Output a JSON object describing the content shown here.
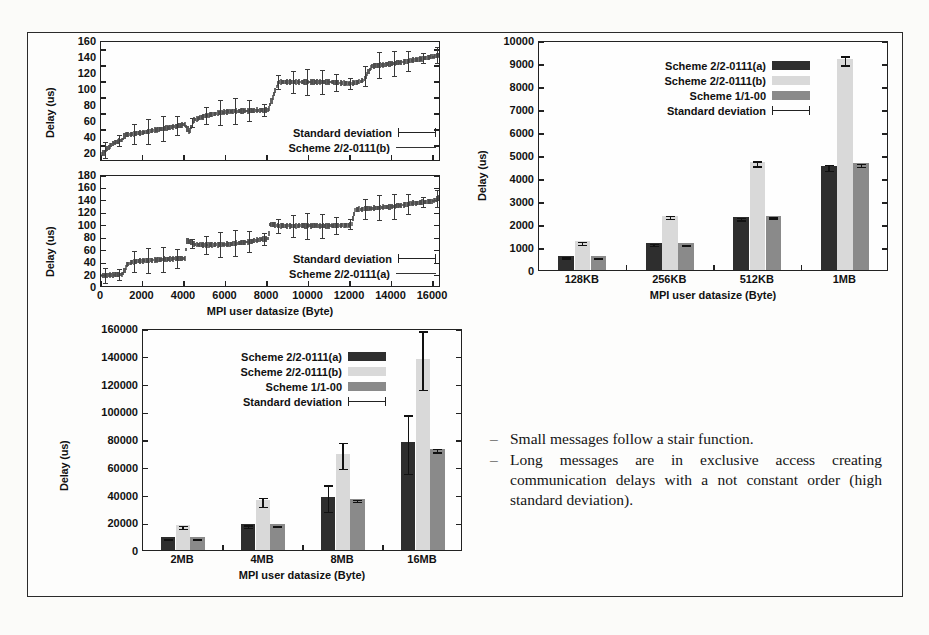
{
  "slide": {
    "bullets": [
      "Small messages follow a stair function.",
      "Long messages are in exclusive access creating communication delays with a not constant order (high standard deviation)."
    ],
    "bullet_dash": "–"
  },
  "legend_labels": {
    "scheme_a": "Scheme 2/2-0111(a)",
    "scheme_b": "Scheme 2/2-0111(b)",
    "scheme_c": "Scheme 1/1-00",
    "stddev": "Standard deviation"
  },
  "colors": {
    "scheme_a": "#2e2e2e",
    "scheme_b": "#d9d9d9",
    "scheme_c": "#8a8a8a",
    "axis": "#222222",
    "frame": "#2b2b2b",
    "background": "#fbfbf9"
  },
  "chart_data": [
    {
      "id": "top-left-upper",
      "type": "line",
      "title": "",
      "xlabel": "",
      "ylabel": "Delay (us)",
      "xlim": [
        0,
        16384
      ],
      "ylim": [
        10,
        160
      ],
      "yticks": [
        20,
        40,
        60,
        80,
        100,
        120,
        140,
        160
      ],
      "xticks": [
        0,
        2000,
        4000,
        6000,
        8000,
        10000,
        12000,
        14000,
        16000
      ],
      "xticklabels": [
        "",
        "",
        "",
        "",
        "",
        "",
        "",
        "",
        ""
      ],
      "grid": false,
      "legend_position": "bottom-right",
      "legend": [
        "Standard deviation",
        "Scheme 2/2-0111(b)"
      ],
      "series": [
        {
          "name": "Scheme 2/2-0111(b)",
          "x": [
            0,
            500,
            1000,
            1100,
            1500,
            2000,
            3000,
            4000,
            4200,
            4400,
            5000,
            6000,
            7000,
            8000,
            8300,
            8500,
            9000,
            10000,
            11000,
            12000,
            12600,
            13000,
            14000,
            15000,
            16000,
            16384
          ],
          "values": [
            20,
            33,
            38,
            44,
            45,
            47,
            52,
            57,
            46,
            62,
            68,
            73,
            74,
            75,
            96,
            110,
            110,
            110,
            110,
            108,
            112,
            130,
            133,
            137,
            142,
            145
          ]
        }
      ]
    },
    {
      "id": "top-left-lower",
      "type": "line",
      "title": "",
      "xlabel": "MPI user datasize (Byte)",
      "ylabel": "Delay (us)",
      "xlim": [
        0,
        16384
      ],
      "ylim": [
        0,
        180
      ],
      "yticks": [
        0,
        20,
        40,
        60,
        80,
        100,
        120,
        140,
        160,
        180
      ],
      "xticks": [
        0,
        2000,
        4000,
        6000,
        8000,
        10000,
        12000,
        14000,
        16000
      ],
      "xticklabels": [
        "0",
        "2000",
        "4000",
        "6000",
        "8000",
        "10000",
        "12000",
        "14000",
        "16000"
      ],
      "grid": false,
      "legend_position": "bottom-right",
      "legend": [
        "Standard deviation",
        "Scheme 2/2-0111(a)"
      ],
      "series": [
        {
          "name": "Scheme 2/2-0111(a)",
          "x": [
            0,
            500,
            1000,
            1200,
            1500,
            2000,
            3000,
            4000,
            4100,
            4500,
            5000,
            6000,
            7000,
            8000,
            8100,
            8500,
            9000,
            10000,
            11000,
            12000,
            12200,
            13000,
            14000,
            15000,
            16000,
            16384
          ],
          "values": [
            20,
            21,
            22,
            38,
            42,
            44,
            46,
            48,
            76,
            70,
            69,
            70,
            74,
            80,
            103,
            100,
            100,
            100,
            100,
            101,
            126,
            128,
            131,
            136,
            140,
            148
          ]
        }
      ]
    },
    {
      "id": "top-right",
      "type": "bar",
      "title": "",
      "xlabel": "MPI user datasize (Byte)",
      "ylabel": "Delay (us)",
      "categories": [
        "128KB",
        "256KB",
        "512KB",
        "1MB"
      ],
      "yticks": [
        0,
        1000,
        2000,
        3000,
        4000,
        5000,
        6000,
        7000,
        8000,
        9000,
        10000
      ],
      "ylim": [
        0,
        10000
      ],
      "grid": false,
      "legend_position": "top-center",
      "series": [
        {
          "name": "Scheme 2/2-0111(a)",
          "values": [
            620,
            1190,
            2300,
            4540
          ],
          "errors": [
            25,
            40,
            60,
            130
          ]
        },
        {
          "name": "Scheme 2/2-0111(b)",
          "values": [
            1250,
            2370,
            4700,
            9180
          ],
          "errors": [
            60,
            70,
            110,
            190
          ]
        },
        {
          "name": "Scheme 1/1-00",
          "values": [
            600,
            1170,
            2340,
            4640
          ],
          "errors": [
            20,
            25,
            40,
            55
          ]
        }
      ]
    },
    {
      "id": "bottom-left",
      "type": "bar",
      "title": "",
      "xlabel": "MPI user datasize (Byte)",
      "ylabel": "Delay (us)",
      "categories": [
        "2MB",
        "4MB",
        "8MB",
        "16MB"
      ],
      "yticks": [
        0,
        20000,
        40000,
        60000,
        80000,
        100000,
        120000,
        140000,
        160000
      ],
      "ylim": [
        0,
        160000
      ],
      "grid": false,
      "legend_position": "top-center",
      "series": [
        {
          "name": "Scheme 2/2-0111(a)",
          "values": [
            9200,
            18400,
            38500,
            77500
          ],
          "errors": [
            400,
            900,
            9500,
            21000
          ]
        },
        {
          "name": "Scheme 2/2-0111(b)",
          "values": [
            17800,
            35800,
            69200,
            138000
          ],
          "errors": [
            900,
            3200,
            9500,
            21000
          ]
        },
        {
          "name": "Scheme 1/1-00",
          "values": [
            9400,
            18500,
            36800,
            73000
          ],
          "errors": [
            300,
            400,
            600,
            1200
          ]
        }
      ]
    }
  ]
}
